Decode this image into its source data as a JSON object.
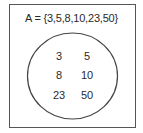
{
  "diagram": {
    "type": "venn-single-set",
    "set_label": "A = {3,5,8,10,23,50}",
    "set_name": "A",
    "elements": [
      {
        "value": "3",
        "col": 0,
        "row": 0
      },
      {
        "value": "5",
        "col": 1,
        "row": 0
      },
      {
        "value": "8",
        "col": 0,
        "row": 1
      },
      {
        "value": "10",
        "col": 1,
        "row": 1
      },
      {
        "value": "23",
        "col": 0,
        "row": 2
      },
      {
        "value": "50",
        "col": 1,
        "row": 2
      }
    ],
    "colors": {
      "stroke": "#444444",
      "frame": "#555555",
      "text": "#2a2a2a",
      "background": "#ffffff"
    }
  }
}
